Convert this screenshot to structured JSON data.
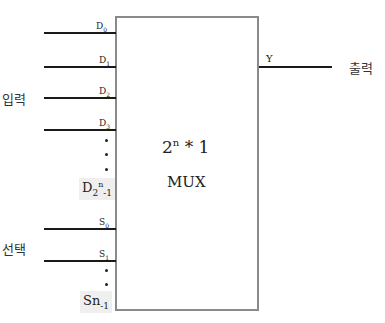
{
  "diagram": {
    "block": {
      "title_base": "2",
      "title_exp": "n",
      "title_rest": " * 1",
      "subtitle": "MUX"
    },
    "input_group_label": "입력",
    "select_group_label": "선택",
    "output_label": "출력",
    "output_pin": "Y",
    "data_inputs": [
      {
        "name": "D",
        "sub": "0"
      },
      {
        "name": "D",
        "sub": "1"
      },
      {
        "name": "D",
        "sub": "2"
      },
      {
        "name": "D",
        "sub": "3"
      }
    ],
    "last_data_input": {
      "name": "D",
      "sub": "2",
      "sup": "n",
      "tail": "-1"
    },
    "select_inputs": [
      {
        "name": "S",
        "sub": "0"
      },
      {
        "name": "S",
        "sub": "1"
      }
    ],
    "last_select_input": {
      "name": "Sn",
      "sub": "-1"
    },
    "colors": {
      "lines": "#1a1a1a",
      "box_border": "#8a8a8a",
      "highlight_bg": "#efefef"
    }
  }
}
